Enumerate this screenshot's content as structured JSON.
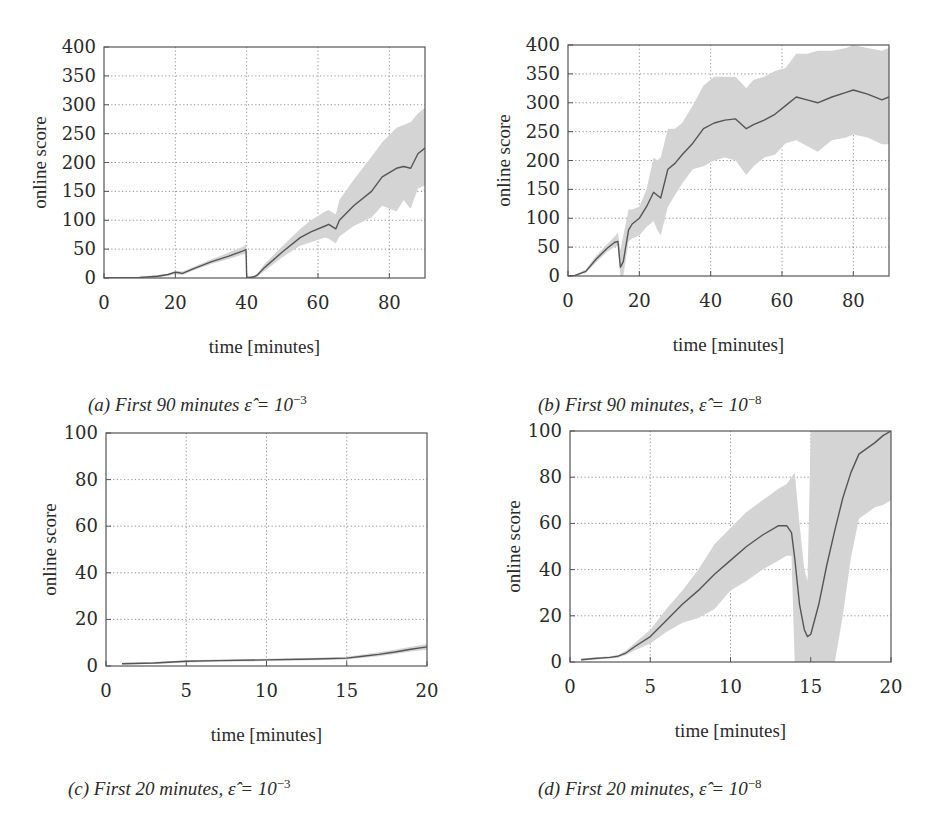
{
  "chart_data": [
    {
      "id": "a",
      "type": "line",
      "caption": "(a) First 90 minutes",
      "caption_math": "ε̂ = 10",
      "caption_exp": "−3",
      "xlabel": "time [minutes]",
      "ylabel": "online score",
      "xlim": [
        0,
        90
      ],
      "ylim": [
        0,
        400
      ],
      "xticks": [
        0,
        20,
        40,
        60,
        80
      ],
      "yticks": [
        0,
        50,
        100,
        150,
        200,
        250,
        300,
        350,
        400
      ],
      "grid": true,
      "legend": null,
      "series": [
        {
          "name": "mean",
          "x": [
            0,
            5,
            10,
            15,
            18,
            20,
            21,
            22,
            25,
            30,
            35,
            39,
            39.8,
            40,
            41,
            42,
            43,
            45,
            50,
            55,
            58,
            62,
            63,
            65,
            66,
            70,
            75,
            78,
            82,
            84,
            86,
            88,
            90
          ],
          "y": [
            0,
            0.5,
            1,
            3,
            6,
            10,
            9,
            8,
            16,
            28,
            38,
            47,
            49,
            1,
            1,
            2,
            5,
            18,
            45,
            70,
            80,
            90,
            93,
            85,
            100,
            125,
            150,
            175,
            190,
            193,
            190,
            215,
            225
          ],
          "lower": [
            0,
            0,
            0,
            1,
            4,
            7,
            6,
            5,
            13,
            24,
            33,
            41,
            42,
            0,
            0,
            0,
            2,
            12,
            36,
            56,
            62,
            70,
            68,
            60,
            72,
            90,
            105,
            125,
            115,
            135,
            120,
            155,
            160
          ],
          "upper": [
            1,
            1,
            2,
            5,
            8,
            12,
            12,
            11,
            19,
            32,
            44,
            54,
            58,
            3,
            3,
            4,
            8,
            24,
            55,
            85,
            100,
            115,
            118,
            110,
            135,
            170,
            210,
            235,
            260,
            265,
            270,
            285,
            295
          ]
        }
      ]
    },
    {
      "id": "b",
      "type": "line",
      "caption": "(b) First 90 minutes,",
      "caption_math": "ε̂ = 10",
      "caption_exp": "−8",
      "xlabel": "time [minutes]",
      "ylabel": "online score",
      "xlim": [
        0,
        90
      ],
      "ylim": [
        0,
        400
      ],
      "xticks": [
        0,
        20,
        40,
        60,
        80
      ],
      "yticks": [
        0,
        50,
        100,
        150,
        200,
        250,
        300,
        350,
        400
      ],
      "grid": true,
      "legend": null,
      "series": [
        {
          "name": "mean",
          "x": [
            0,
            2,
            5,
            8,
            11,
            13,
            14,
            14.7,
            15.5,
            17,
            18,
            20,
            22,
            24,
            25,
            26,
            28,
            30,
            32,
            35,
            38,
            41,
            44,
            47,
            50,
            52,
            55,
            58,
            61,
            64,
            67,
            70,
            74,
            78,
            80,
            84,
            88,
            90
          ],
          "y": [
            0,
            1,
            8,
            30,
            48,
            58,
            60,
            15,
            25,
            80,
            90,
            100,
            120,
            145,
            140,
            135,
            185,
            195,
            210,
            230,
            255,
            265,
            270,
            272,
            255,
            262,
            270,
            280,
            295,
            310,
            305,
            300,
            310,
            318,
            322,
            315,
            305,
            310
          ],
          "lower": [
            0,
            0,
            5,
            24,
            42,
            50,
            53,
            0,
            0,
            60,
            65,
            70,
            85,
            95,
            80,
            70,
            120,
            140,
            160,
            185,
            190,
            200,
            205,
            200,
            175,
            190,
            205,
            210,
            230,
            235,
            225,
            215,
            235,
            240,
            245,
            240,
            228,
            228
          ],
          "upper": [
            1,
            2,
            11,
            36,
            55,
            68,
            75,
            45,
            70,
            115,
            115,
            120,
            150,
            205,
            200,
            205,
            255,
            255,
            265,
            295,
            330,
            345,
            345,
            345,
            325,
            340,
            345,
            355,
            360,
            385,
            385,
            390,
            390,
            395,
            405,
            395,
            390,
            395
          ]
        }
      ]
    },
    {
      "id": "c",
      "type": "line",
      "caption": "(c) First 20 minutes,",
      "caption_math": "ε̂ = 10",
      "caption_exp": "−3",
      "xlabel": "time [minutes]",
      "ylabel": "online score",
      "xlim": [
        0,
        20
      ],
      "ylim": [
        0,
        100
      ],
      "xticks": [
        0,
        5,
        10,
        15,
        20
      ],
      "yticks": [
        0,
        20,
        40,
        60,
        80,
        100
      ],
      "grid": true,
      "legend": null,
      "series": [
        {
          "name": "mean",
          "x": [
            1,
            3,
            5,
            7,
            10,
            13,
            15,
            16,
            17,
            18,
            19,
            20
          ],
          "y": [
            1,
            1.3,
            2,
            2.3,
            2.6,
            3,
            3.4,
            4.2,
            5,
            6,
            7.2,
            8.2
          ],
          "lower": [
            0.6,
            0.9,
            1.5,
            1.8,
            2.1,
            2.5,
            2.8,
            3.5,
            4.2,
            5.1,
            6.2,
            7
          ],
          "upper": [
            1.4,
            1.7,
            2.5,
            2.8,
            3.1,
            3.5,
            4,
            4.9,
            5.9,
            7,
            8.3,
            9.5
          ]
        }
      ]
    },
    {
      "id": "d",
      "type": "line",
      "caption": "(d) First 20 minutes,",
      "caption_math": "ε̂ = 10",
      "caption_exp": "−8",
      "xlabel": "time [minutes]",
      "ylabel": "online score",
      "xlim": [
        0,
        20
      ],
      "ylim": [
        0,
        100
      ],
      "xticks": [
        0,
        5,
        10,
        15,
        20
      ],
      "yticks": [
        0,
        20,
        40,
        60,
        80,
        100
      ],
      "grid": true,
      "legend": null,
      "series": [
        {
          "name": "mean",
          "x": [
            0.7,
            1.5,
            2.5,
            3,
            3.5,
            4,
            5,
            6,
            7,
            8,
            9,
            10,
            11,
            12,
            13,
            13.5,
            13.8,
            14,
            14.3,
            14.6,
            14.8,
            15,
            15.5,
            16,
            16.5,
            17,
            17.5,
            18,
            19,
            19.5,
            20
          ],
          "y": [
            1,
            1.5,
            2,
            2.5,
            4,
            6.5,
            11,
            18,
            25,
            31,
            38,
            44,
            50,
            55,
            59,
            59,
            56,
            45,
            25,
            14,
            11,
            12,
            25,
            42,
            57,
            71,
            82,
            90,
            95,
            98,
            100
          ],
          "lower": [
            0.5,
            1,
            1.5,
            2,
            3,
            5,
            8,
            13,
            17,
            19,
            23,
            31,
            35,
            40,
            44,
            46,
            46,
            0,
            0,
            0,
            0,
            0,
            0,
            0,
            0,
            20,
            45,
            62,
            67,
            68,
            70
          ],
          "upper": [
            1.5,
            2,
            2.5,
            3,
            5,
            8,
            14,
            23,
            31,
            40,
            51,
            58,
            65,
            70,
            75,
            77,
            80,
            82,
            60,
            40,
            35,
            102,
            102,
            102,
            102,
            102,
            102,
            102,
            102,
            102,
            102
          ]
        }
      ]
    }
  ],
  "layout": {
    "panels": [
      {
        "id": "a",
        "left": 104,
        "top": 47,
        "right": 425,
        "bottom": 278
      },
      {
        "id": "b",
        "left": 568,
        "top": 45,
        "right": 889,
        "bottom": 276
      },
      {
        "id": "c",
        "left": 106,
        "top": 433,
        "right": 427,
        "bottom": 666
      },
      {
        "id": "d",
        "left": 570,
        "top": 431,
        "right": 891,
        "bottom": 662
      }
    ],
    "colors": {
      "line": "#555555",
      "band": "#d4d4d4",
      "grid": "#777777",
      "frame": "#555555",
      "text": "#2a2a2a"
    }
  }
}
